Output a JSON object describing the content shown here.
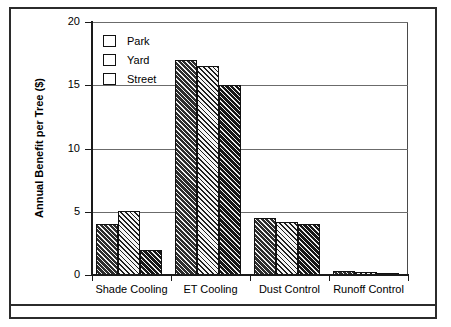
{
  "figure": {
    "has_outer_frame": true,
    "has_caption_divider": true
  },
  "chart_data": {
    "type": "bar",
    "title": "",
    "xlabel": "",
    "ylabel": "Annual Benefit per Tree ($)",
    "categories": [
      "Shade Cooling",
      "ET Cooling",
      "Dust Control",
      "Runoff Control"
    ],
    "series": [
      {
        "name": "Park",
        "values": [
          4.0,
          17.0,
          4.5,
          0.3
        ],
        "color": "#2e2e2e",
        "hatch": "dark-diagonal"
      },
      {
        "name": "Yard",
        "values": [
          5.1,
          16.5,
          4.2,
          0.2
        ],
        "color": "#f4f4f4",
        "hatch": "light-diagonal"
      },
      {
        "name": "Street",
        "values": [
          2.0,
          15.0,
          4.0,
          0.1
        ],
        "color": "#6e6e6e",
        "hatch": "gray-diagonal"
      }
    ],
    "ylim": [
      0,
      20
    ],
    "yticks": [
      0,
      5,
      10,
      15,
      20
    ],
    "ytick_labels": [
      "0",
      "5",
      "10",
      "15",
      "20"
    ],
    "grid": "horizontal",
    "legend_position": "top-left-inside"
  },
  "legend": {
    "entries": [
      {
        "label": "Park"
      },
      {
        "label": "Yard"
      },
      {
        "label": "Street"
      }
    ]
  }
}
